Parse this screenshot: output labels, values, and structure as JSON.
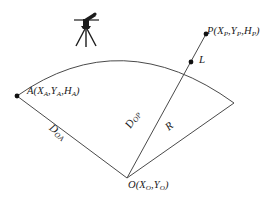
{
  "figure": {
    "stroke_color": "#4a4a4a",
    "text_color": "#1a1a1a",
    "background": "#ffffff",
    "instrument_color": "#1c1c1c"
  },
  "labels": {
    "point_p": {
      "name": "P",
      "coords": "(X P,Y P,H P)",
      "base": "P",
      "sub1": "P",
      "sub2": "P",
      "sub3": "P",
      "vars": [
        "X",
        "Y",
        "H"
      ]
    },
    "point_a": {
      "name": "A",
      "base": "A",
      "vars": [
        "X",
        "Y",
        "H"
      ],
      "sub": "A"
    },
    "point_o": {
      "name": "O",
      "base": "O",
      "vars": [
        "X",
        "Y"
      ],
      "sub": "O"
    },
    "segment_l": "L",
    "radius_r": "R",
    "distance_oa": {
      "base": "D",
      "sub": "OA"
    },
    "distance_op": {
      "base": "D",
      "sub": "OP"
    }
  },
  "text": {
    "P_base": "P",
    "P_open": "(",
    "P_X": "X",
    "P_Xsub": "P",
    "P_comma1": ",",
    "P_Y": "Y",
    "P_Ysub": "P",
    "P_comma2": ",",
    "P_H": "H",
    "P_Hsub": "P",
    "P_close": ")",
    "A_base": "A",
    "A_open": "(",
    "A_X": "X",
    "A_Xsub": "A",
    "A_comma1": ",",
    "A_Y": "Y",
    "A_Ysub": "A",
    "A_comma2": ",",
    "A_H": "H",
    "A_Hsub": "A",
    "A_close": ")",
    "O_base": "O",
    "O_open": "(",
    "O_X": "X",
    "O_Xsub": "O",
    "O_comma1": ",",
    "O_Y": "Y",
    "O_Ysub": "O",
    "O_close": ")",
    "L": "L",
    "R": "R",
    "D_base_oa": "D",
    "D_sub_oa": "OA",
    "D_base_op": "D",
    "D_sub_op": "OP"
  },
  "geometry": {
    "center_o": [
      127,
      178
    ],
    "point_a": [
      17,
      96
    ],
    "point_p": [
      206,
      34
    ],
    "point_l": [
      191,
      62
    ],
    "arc_right_end": [
      234,
      103
    ],
    "radius_px": 137,
    "instrument_position": [
      86,
      28
    ]
  }
}
